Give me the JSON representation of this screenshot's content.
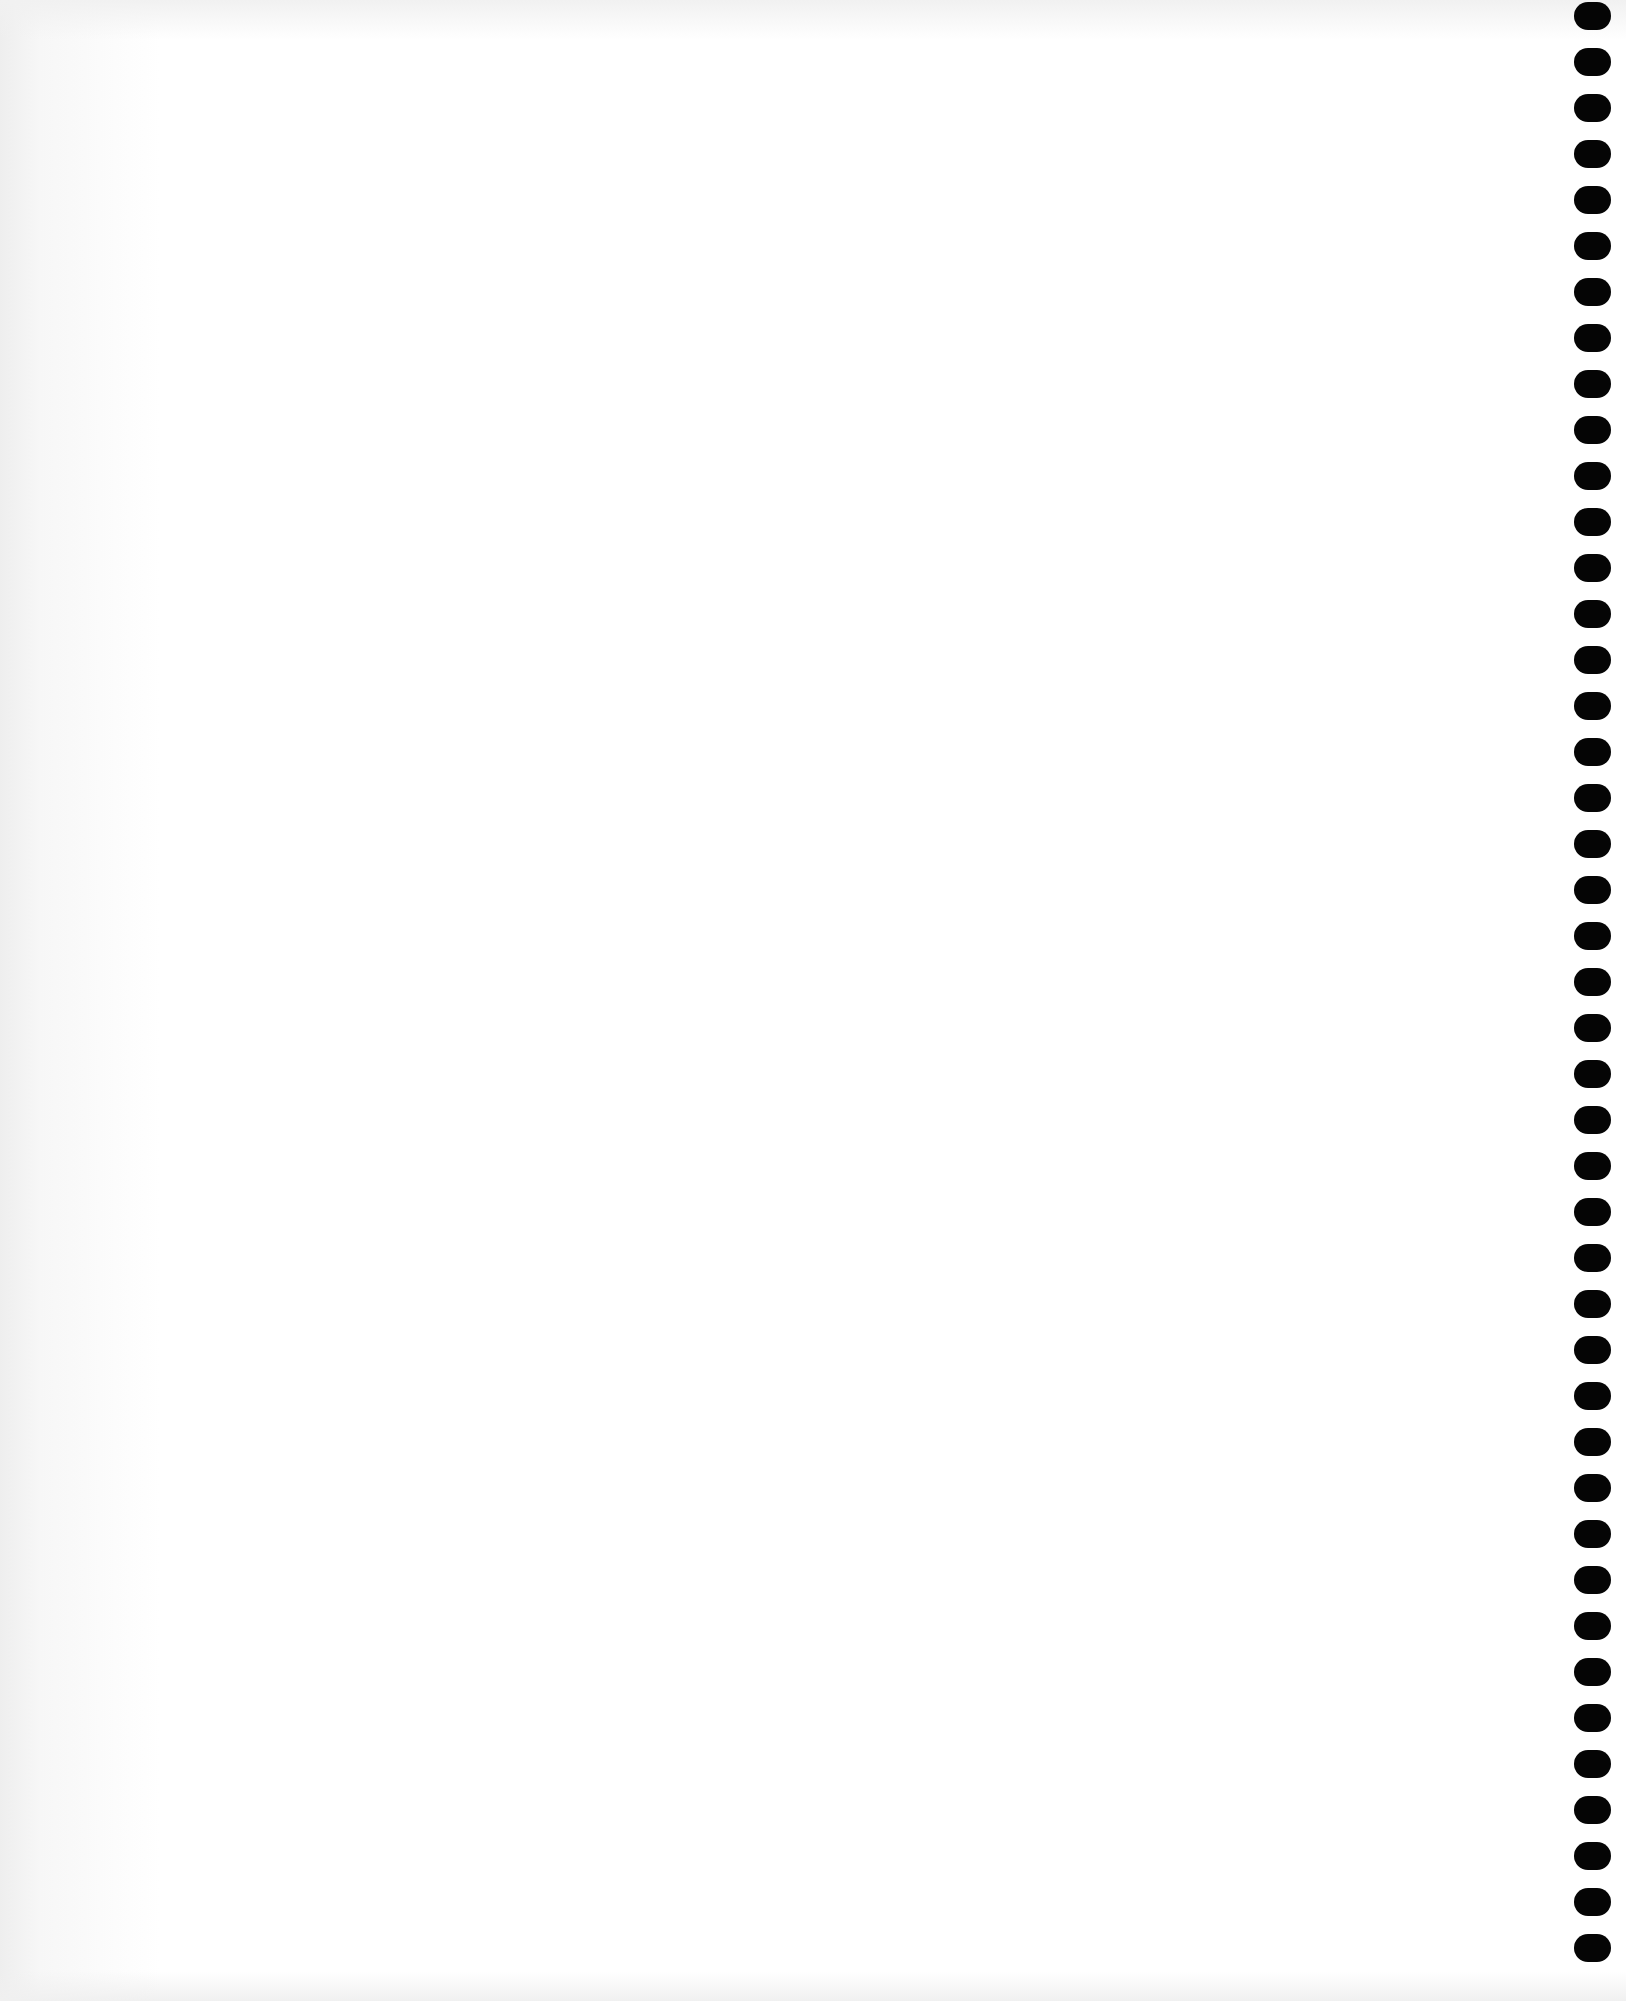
{
  "page": {
    "type": "blank spiral notebook page",
    "background_color": "#ffffff",
    "hole_color": "#050505"
  },
  "binding_holes": {
    "count": 43,
    "first_top": 2,
    "spacing": 46,
    "side": "right"
  }
}
